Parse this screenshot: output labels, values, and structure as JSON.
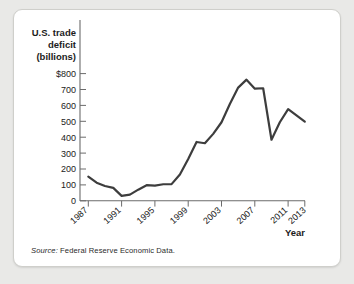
{
  "figure": {
    "source_prefix": "Source:",
    "source_text": " Federal Reserve Economic Data.",
    "line_color": "#3d3d3d",
    "axis_color": "#6b6b6b",
    "card_background": "#ffffff",
    "page_background": "#e9e9e7"
  },
  "chart_data": {
    "type": "line",
    "title": "",
    "ylabel": "U.S. trade deficit (billions)",
    "ylabel_lines": [
      "U.S. trade",
      "deficit",
      "(billions)"
    ],
    "xlabel": "Year",
    "ylim": [
      0,
      800
    ],
    "xlim": [
      1987,
      2013
    ],
    "ytick_labels": [
      "$800",
      "700",
      "600",
      "500",
      "400",
      "300",
      "200",
      "100",
      "0"
    ],
    "ytick_values": [
      800,
      700,
      600,
      500,
      400,
      300,
      200,
      100,
      0
    ],
    "xtick_labels": [
      "1987",
      "1991",
      "1995",
      "1999",
      "2003",
      "2007",
      "2011",
      "2013"
    ],
    "xtick_values": [
      1987,
      1991,
      1995,
      1999,
      2003,
      2007,
      2011,
      2013
    ],
    "grid": false,
    "legend": false,
    "x": [
      1987,
      1988,
      1989,
      1990,
      1991,
      1992,
      1993,
      1994,
      1995,
      1996,
      1997,
      1998,
      1999,
      2000,
      2001,
      2002,
      2003,
      2004,
      2005,
      2006,
      2007,
      2008,
      2009,
      2010,
      2011,
      2012,
      2013
    ],
    "values": [
      152,
      114,
      93,
      81,
      31,
      39,
      70,
      98,
      96,
      104,
      105,
      166,
      263,
      370,
      362,
      421,
      494,
      609,
      712,
      762,
      705,
      708,
      384,
      494,
      577,
      537,
      498
    ],
    "series": [
      {
        "name": "U.S. trade deficit",
        "values": [
          152,
          114,
          93,
          81,
          31,
          39,
          70,
          98,
          96,
          104,
          105,
          166,
          263,
          370,
          362,
          421,
          494,
          609,
          712,
          762,
          705,
          708,
          384,
          494,
          577,
          537,
          498
        ]
      }
    ]
  }
}
